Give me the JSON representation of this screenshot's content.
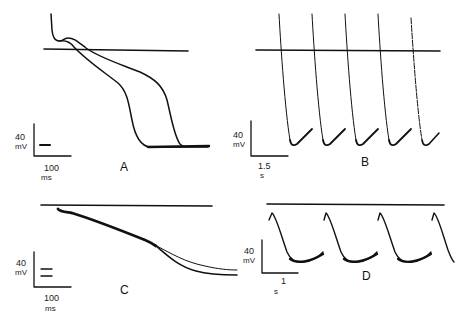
{
  "figure": {
    "type": "electrophysiology-action-potential-traces",
    "stroke_color": "#111111",
    "background": "#ffffff"
  },
  "panels": [
    {
      "id": "A",
      "label": "A",
      "scale_bar": {
        "voltage_value": "40",
        "voltage_unit": "mV",
        "time_value": "100",
        "time_unit": "ms"
      },
      "reference_line": "zero-potential line",
      "traces": [
        "short action potential",
        "long action potential"
      ],
      "marker_dashes": 1
    },
    {
      "id": "B",
      "label": "B",
      "scale_bar": {
        "voltage_value": "40",
        "voltage_unit": "mV",
        "time_value": "1.5",
        "time_unit": "s"
      },
      "reference_line": "zero-potential line",
      "beats": 5
    },
    {
      "id": "C",
      "label": "C",
      "scale_bar": {
        "voltage_value": "40",
        "voltage_unit": "mV",
        "time_value": "100",
        "time_unit": "ms"
      },
      "reference_line": "zero-potential line",
      "traces": [
        "trace 1",
        "trace 2"
      ],
      "marker_dashes": 2
    },
    {
      "id": "D",
      "label": "D",
      "scale_bar": {
        "voltage_value": "40",
        "voltage_unit": "mV",
        "time_value": "1",
        "time_unit": "s"
      },
      "reference_line": "zero-potential line",
      "beats": 4
    }
  ]
}
